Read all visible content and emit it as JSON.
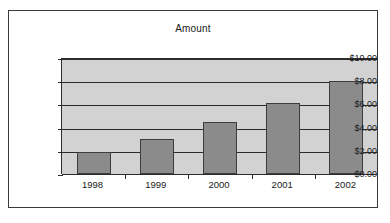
{
  "chart_data": {
    "type": "bar",
    "title": "Amount",
    "xlabel": "",
    "ylabel": "",
    "categories": [
      "1998",
      "1999",
      "2000",
      "2001",
      "2002"
    ],
    "values": [
      1.9,
      3.0,
      4.5,
      6.1,
      8.0
    ],
    "ylim": [
      0,
      10
    ],
    "ytick_labels": [
      "$10.00",
      "$8.00",
      "$6.00",
      "$4.00",
      "$2.00",
      "$0.00"
    ],
    "ytick_values": [
      10,
      8,
      6,
      4,
      2,
      0
    ],
    "grid": true,
    "legend": false,
    "colors": {
      "bar_fill": "#8b8b8b",
      "bar_border": "#3d3d3d",
      "plot_background": "#d2d2d2",
      "gridline": "#2b2b2b",
      "axis": "#2b2b2b",
      "frame_border": "#3a3a3a",
      "page_background": "#ffffff",
      "text": "#1a1a1a"
    }
  }
}
